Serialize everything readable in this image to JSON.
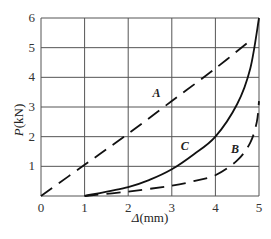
{
  "chart_data": {
    "type": "line",
    "title": "",
    "xlabel": "Δ(mm)",
    "ylabel": "P(kN)",
    "xlim": [
      0,
      5
    ],
    "ylim": [
      0,
      6
    ],
    "x_ticks": [
      "0",
      "1",
      "2",
      "3",
      "4",
      "5"
    ],
    "y_ticks": [
      "1",
      "2",
      "3",
      "4",
      "5",
      "6"
    ],
    "grid": true,
    "legend": "none (curves labeled inline)",
    "series": [
      {
        "name": "A",
        "style": "dashed",
        "x": [
          0,
          1,
          2,
          3,
          4,
          4.85
        ],
        "y": [
          0,
          1.05,
          2.1,
          3.2,
          4.3,
          5.3
        ]
      },
      {
        "name": "B",
        "style": "dashed",
        "x": [
          1.0,
          2.0,
          3.0,
          3.5,
          4.0,
          4.5,
          4.8,
          4.95,
          5.0
        ],
        "y": [
          0.0,
          0.15,
          0.35,
          0.5,
          0.7,
          1.2,
          1.8,
          2.5,
          3.2
        ]
      },
      {
        "name": "C",
        "style": "solid",
        "x": [
          1.0,
          2.0,
          2.5,
          3.0,
          3.5,
          4.0,
          4.5,
          4.8,
          5.0
        ],
        "y": [
          0.0,
          0.3,
          0.55,
          0.9,
          1.4,
          2.0,
          3.1,
          4.3,
          6.0
        ]
      }
    ],
    "annotations": [
      {
        "text": "A",
        "x": 2.65,
        "y": 3.35
      },
      {
        "text": "B",
        "x": 4.45,
        "y": 1.45
      },
      {
        "text": "C",
        "x": 3.3,
        "y": 1.55
      }
    ]
  },
  "labels": {
    "xlabel_prefix": "Δ",
    "xlabel_unit": "(mm)",
    "ylabel_prefix": "P",
    "ylabel_unit": "(kN)",
    "origin": "0",
    "curve_A": "A",
    "curve_B": "B",
    "curve_C": "C"
  }
}
